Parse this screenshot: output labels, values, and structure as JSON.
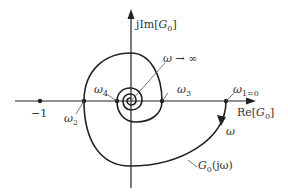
{
  "diagram": {
    "type": "nyquist-plot",
    "axes": {
      "imag_label_prefix": "jIm[",
      "imag_label_var": "G",
      "imag_label_sub": "0",
      "imag_label_suffix": "]",
      "real_label_prefix": "Re[",
      "real_label_var": "G",
      "real_label_sub": "0",
      "real_label_suffix": "]"
    },
    "points": {
      "minus_one": "−1",
      "omega_symbol": "ω",
      "omega1_sub": "1=0",
      "omega2_sub": "2",
      "omega3_sub": "3",
      "omega4_sub": "4"
    },
    "annotations": {
      "omega_infinity": "ω → ∞",
      "direction_label": "ω",
      "curve_label_var": "G",
      "curve_label_sub": "0",
      "curve_label_arg": "(jω)"
    },
    "colors": {
      "stroke": "#222222",
      "leader": "#555555",
      "background": "#ffffff"
    }
  }
}
